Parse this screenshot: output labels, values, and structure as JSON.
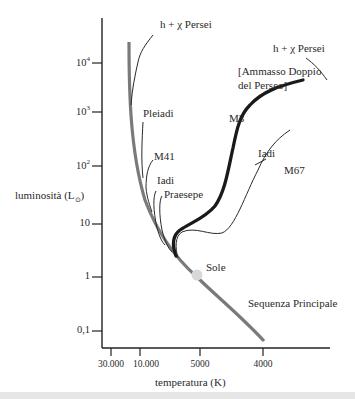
{
  "diagram": {
    "y_axis": {
      "label": "luminosità (L",
      "label_sub": "⊙",
      "label_end": ")",
      "ticks": [
        {
          "base": "10",
          "exp": "4"
        },
        {
          "base": "10",
          "exp": "3"
        },
        {
          "base": "10",
          "exp": "2"
        },
        {
          "base": "10",
          "exp": ""
        },
        {
          "base": "1",
          "exp": ""
        },
        {
          "base": "0,1",
          "exp": ""
        }
      ]
    },
    "x_axis": {
      "label": "temperatura (K)",
      "ticks": [
        "30.000",
        "10.000",
        "5000",
        "4000"
      ]
    },
    "labels": {
      "h_chi_persei_top": "h + χ Persei",
      "h_chi_persei_legend": "h + χ Persei",
      "ammasso_line1": "[Ammasso Doppio",
      "ammasso_line2": "del Perseo]",
      "pleiadi": "Pleiadi",
      "m41": "M41",
      "iadi_left": "Iadi",
      "praesepe": "Praesepe",
      "m3": "M3",
      "iadi_right": "Iadi",
      "m67": "M67",
      "sole": "Sole",
      "sequenza_principale": "Sequenza Principale"
    },
    "colors": {
      "main_sequence": "#7a7a7a",
      "m3": "#1a1a1a",
      "cluster_lines": "#2a2a2a",
      "sun": "#d8d8d8",
      "axis": "#222222"
    }
  }
}
